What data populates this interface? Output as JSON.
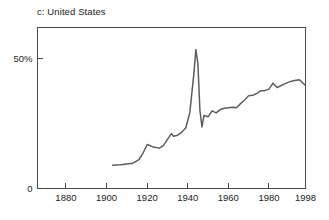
{
  "chart_data": {
    "type": "line",
    "title": "c: United States",
    "xlabel": "",
    "ylabel": "",
    "xlim": [
      1866,
      1998
    ],
    "ylim": [
      0,
      62
    ],
    "grid": false,
    "legend": null,
    "yticks": [
      {
        "value": 0,
        "label": "0"
      },
      {
        "value": 50,
        "label": "50%"
      }
    ],
    "xticks": [
      {
        "value": 1880,
        "label": "1880"
      },
      {
        "value": 1900,
        "label": "1900"
      },
      {
        "value": 1920,
        "label": "1920"
      },
      {
        "value": 1940,
        "label": "1940"
      },
      {
        "value": 1960,
        "label": "1960"
      },
      {
        "value": 1980,
        "label": "1980"
      },
      {
        "value": 1998,
        "label": "1998"
      }
    ],
    "series": [
      {
        "name": "United States",
        "color": "#5d5d5d",
        "x": [
          1903,
          1907,
          1910,
          1913,
          1916,
          1918,
          1920,
          1921,
          1923,
          1926,
          1928,
          1930,
          1932,
          1933,
          1935,
          1937,
          1939,
          1941,
          1943,
          1944,
          1945,
          1946,
          1947,
          1948,
          1950,
          1952,
          1954,
          1956,
          1958,
          1960,
          1962,
          1964,
          1966,
          1968,
          1970,
          1972,
          1974,
          1976,
          1978,
          1980,
          1982,
          1984,
          1986,
          1988,
          1990,
          1992,
          1995,
          1998
        ],
        "y": [
          8.8,
          9.0,
          9.3,
          9.6,
          11.0,
          13.5,
          16.8,
          16.5,
          15.8,
          15.4,
          16.4,
          18.8,
          21.0,
          20.0,
          20.4,
          21.5,
          23.2,
          29.0,
          44.0,
          53.5,
          48.0,
          30.0,
          23.6,
          28.0,
          27.5,
          29.8,
          29.0,
          30.3,
          30.8,
          31.0,
          31.2,
          31.0,
          32.6,
          34.0,
          35.6,
          35.8,
          36.5,
          37.6,
          37.6,
          38.2,
          40.5,
          38.8,
          39.6,
          40.3,
          41.0,
          41.4,
          41.8,
          39.6
        ]
      }
    ]
  },
  "figure": {
    "background_color": "#ffffff",
    "axis_color": "#4a4a4a",
    "text_color": "#1c1c1c"
  }
}
